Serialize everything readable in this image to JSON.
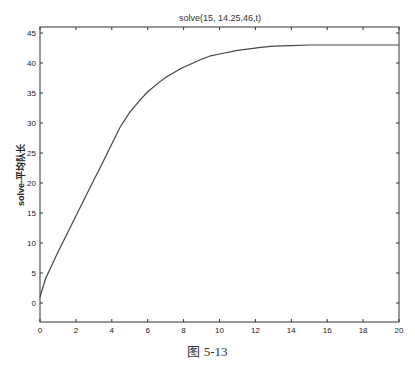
{
  "figure": {
    "caption": "图 5-13"
  },
  "chart_data": {
    "type": "line",
    "title": "solve(15, 14.25,46,t)",
    "xlabel": "",
    "ylabel": "solve-平均队长",
    "xlim": [
      0,
      20
    ],
    "ylim": [
      -3,
      46
    ],
    "xticks": [
      0,
      2,
      4,
      6,
      8,
      10,
      12,
      14,
      16,
      18,
      20
    ],
    "yticks": [
      0,
      5,
      10,
      15,
      20,
      25,
      30,
      35,
      40,
      45
    ],
    "grid": false,
    "legend": null,
    "series": [
      {
        "name": "solve",
        "color": "#444444",
        "x": [
          0,
          0.3,
          1,
          2,
          3,
          3.34,
          4,
          4.46,
          5,
          5.57,
          6,
          6.69,
          7,
          7.8,
          8,
          8.9,
          9.5,
          10,
          11,
          12.3,
          13,
          14,
          15,
          16,
          17,
          18,
          19,
          20
        ],
        "y": [
          1,
          4,
          8.5,
          14.5,
          20.5,
          22.5,
          26.5,
          29.3,
          31.8,
          33.8,
          35.2,
          36.9,
          37.6,
          39.0,
          39.3,
          40.5,
          41.2,
          41.5,
          42.1,
          42.6,
          42.8,
          42.9,
          43.0,
          43.0,
          43.0,
          43.0,
          43.0,
          43.0
        ]
      }
    ]
  }
}
